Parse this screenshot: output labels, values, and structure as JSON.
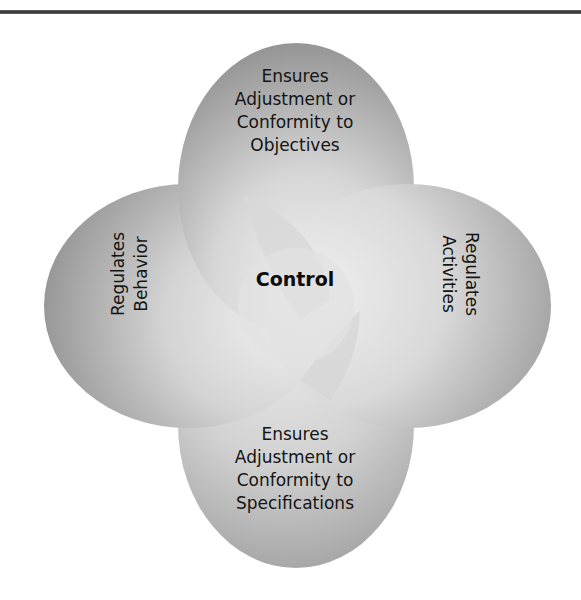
{
  "diagram": {
    "center": {
      "label": "Control"
    },
    "petals": {
      "top": {
        "lines": [
          "Ensures",
          "Adjustment or",
          "Conformity to",
          "Objectives"
        ]
      },
      "right": {
        "lines": [
          "Regulates",
          "Activities"
        ]
      },
      "bottom": {
        "lines": [
          "Ensures",
          "Adjustment or",
          "Conformity to",
          "Specifications"
        ]
      },
      "left": {
        "lines": [
          "Regulates",
          "Behavior"
        ]
      }
    }
  },
  "colors": {
    "petal_dark": "#8a8a8a",
    "petal_mid": "#b8b8b8",
    "petal_light": "#e6e6e6",
    "rule": "#3a3a3a",
    "text": "#141414"
  }
}
